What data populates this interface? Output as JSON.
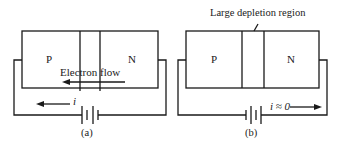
{
  "diagram_a": {
    "p_label": "P",
    "n_label": "N",
    "electron_flow_label": "Electron flow",
    "current_label": "i",
    "caption": "(a)"
  },
  "diagram_b": {
    "p_label": "P",
    "n_label": "N",
    "depletion_label": "Large depletion region",
    "current_label": "i ≈ 0",
    "caption": "(b)"
  },
  "colors": {
    "ink": "#1a1a1a",
    "background": "#ffffff"
  }
}
